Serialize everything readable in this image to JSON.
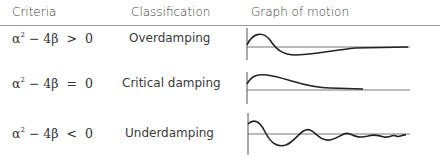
{
  "table": {
    "headers": [
      "Criteria",
      "Classification",
      "Graph of motion"
    ],
    "rows": [
      {
        "criteria_base": "α",
        "criteria_exp": "2",
        "criteria_rest": " − 4β  >  0",
        "classification": "Overdamping",
        "graph": "overdamped-curve"
      },
      {
        "criteria_base": "α",
        "criteria_exp": "2",
        "criteria_rest": " − 4β  =  0",
        "classification": "Critical damping",
        "graph": "critically-damped-curve"
      },
      {
        "criteria_base": "α",
        "criteria_exp": "2",
        "criteria_rest": " − 4β  <  0",
        "classification": "Underdamping",
        "graph": "underdamped-curve"
      }
    ]
  }
}
